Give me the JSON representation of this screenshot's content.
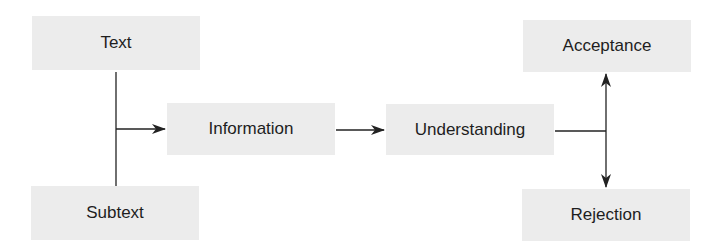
{
  "diagram": {
    "type": "flowchart",
    "colors": {
      "box_fill": "#ececec",
      "line": "#222222",
      "text": "#1e1e1e",
      "background": "#ffffff"
    },
    "nodes": [
      {
        "id": "text",
        "label": "Text",
        "x": 32,
        "y": 16,
        "w": 168,
        "h": 54
      },
      {
        "id": "subtext",
        "label": "Subtext",
        "x": 31,
        "y": 186,
        "w": 168,
        "h": 54
      },
      {
        "id": "information",
        "label": "Information",
        "x": 167,
        "y": 103,
        "w": 168,
        "h": 52
      },
      {
        "id": "understanding",
        "label": "Understanding",
        "x": 386,
        "y": 104,
        "w": 168,
        "h": 51
      },
      {
        "id": "acceptance",
        "label": "Acceptance",
        "x": 523,
        "y": 20,
        "w": 168,
        "h": 52
      },
      {
        "id": "rejection",
        "label": "Rejection",
        "x": 522,
        "y": 189,
        "w": 168,
        "h": 52
      }
    ],
    "edges": [
      {
        "from": [
          "text",
          "subtext"
        ],
        "to": "information",
        "style": "merge-arrow"
      },
      {
        "from": "information",
        "to": "understanding",
        "style": "arrow"
      },
      {
        "from": "understanding",
        "to": [
          "acceptance",
          "rejection"
        ],
        "style": "split-arrow"
      }
    ]
  }
}
